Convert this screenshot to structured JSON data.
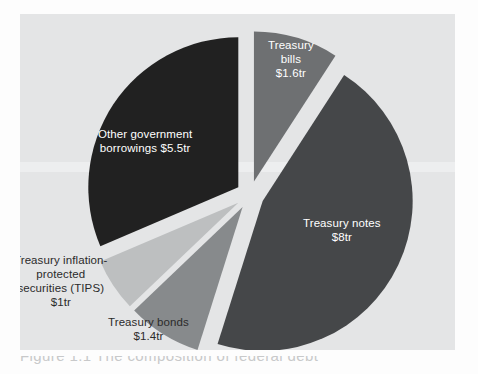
{
  "figure": {
    "panel_background": "#e4e5e6",
    "page_background": "#fdfdfd",
    "caption_partial": "Figure 1.1  The composition of federal debt"
  },
  "chart_data": {
    "type": "pie",
    "title": "",
    "subtitle": "",
    "xlabel": "",
    "ylabel": "",
    "legend_position": "none",
    "grid": false,
    "units": "trillions of US dollars",
    "total": 17.5,
    "exploded": true,
    "start_angle_deg": 0,
    "center": {
      "x": 250,
      "y": 195
    },
    "radius": 150,
    "categories": [
      "Treasury bills",
      "Treasury notes",
      "Treasury bonds",
      "Treasury inflation-protected securities (TIPS)",
      "Other government borrowings"
    ],
    "values": [
      1.6,
      8.0,
      1.4,
      1.0,
      5.5
    ],
    "value_labels": [
      "$1.6tr",
      "$8tr",
      "$1.4tr",
      "$1tr",
      "$5.5tr"
    ],
    "colors": [
      "#6e7072",
      "#454749",
      "#878a8c",
      "#bdbfc0",
      "#212121"
    ],
    "slices": [
      {
        "name": "treasury-bills",
        "label": "Treasury\nbills\n$1.6tr",
        "category": "Treasury bills",
        "value": 1.6,
        "value_label": "$1.6tr",
        "percent": 9.1,
        "color": "#6e7072",
        "start_deg": 0,
        "end_deg": 32.9,
        "explode": 14,
        "label_placement": "inside",
        "label_x": 268,
        "label_y": 38
      },
      {
        "name": "treasury-notes",
        "label": "Treasury notes\n$8tr",
        "category": "Treasury notes",
        "value": 8.0,
        "value_label": "$8tr",
        "percent": 45.7,
        "color": "#454749",
        "start_deg": 32.9,
        "end_deg": 197.5,
        "explode": 14,
        "label_placement": "inside",
        "label_x": 303,
        "label_y": 216
      },
      {
        "name": "treasury-bonds",
        "label": "Treasury bonds\n$1.4tr",
        "category": "Treasury bonds",
        "value": 1.4,
        "value_label": "$1.4tr",
        "percent": 8.0,
        "color": "#878a8c",
        "start_deg": 197.5,
        "end_deg": 226.3,
        "explode": 14,
        "label_placement": "outside",
        "label_x": 108,
        "label_y": 315
      },
      {
        "name": "treasury-tips",
        "label": "Treasury inflation-\nprotected\nsecurities (TIPS)\n$1tr",
        "category": "Treasury inflation-protected securities (TIPS)",
        "value": 1.0,
        "value_label": "$1tr",
        "percent": 5.7,
        "color": "#bdbfc0",
        "start_deg": 226.3,
        "end_deg": 246.9,
        "explode": 14,
        "label_placement": "outside",
        "label_x": 14,
        "label_y": 253
      },
      {
        "name": "other-government-borrowings",
        "label": "Other government\nborrowings $5.5tr",
        "category": "Other government borrowings",
        "value": 5.5,
        "value_label": "$5.5tr",
        "percent": 31.4,
        "color": "#212121",
        "start_deg": 246.9,
        "end_deg": 360,
        "explode": 14,
        "label_placement": "inside",
        "label_x": 98,
        "label_y": 127
      }
    ]
  }
}
